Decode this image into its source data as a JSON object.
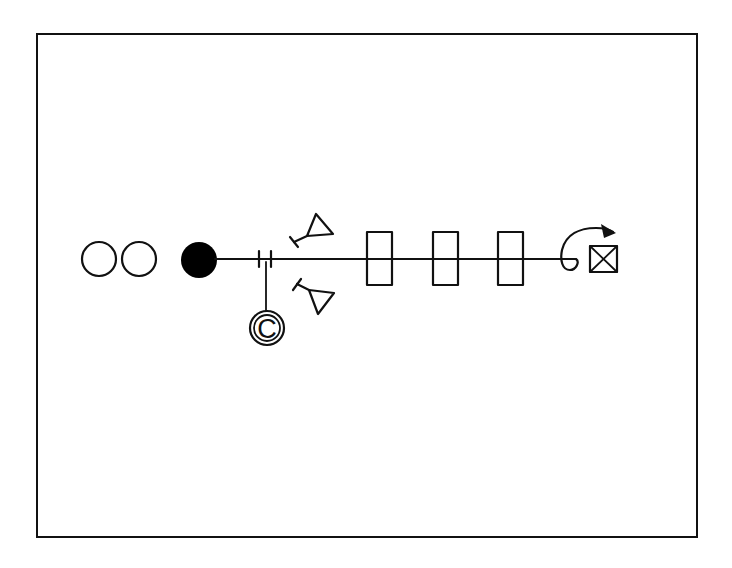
{
  "diagram": {
    "type": "beamline-schematic",
    "colors": {
      "stroke": "#111111",
      "background": "#ffffff",
      "filled_source": "#000000"
    },
    "frame": {
      "x": 37,
      "y": 34,
      "width": 660,
      "height": 503
    },
    "beamline": {
      "y": 259,
      "x_start": 199,
      "x_end": 570
    },
    "elements": [
      {
        "name": "open-circle-1",
        "kind": "open-circle",
        "cx": 99,
        "cy": 259,
        "r": 17
      },
      {
        "name": "open-circle-2",
        "kind": "open-circle",
        "cx": 139,
        "cy": 259,
        "r": 17
      },
      {
        "name": "filled-source",
        "kind": "filled-circle",
        "cx": 199,
        "cy": 260,
        "r": 18
      },
      {
        "name": "capacitor",
        "kind": "capacitor-gap",
        "x1": 259,
        "x2": 271,
        "y_top": 251,
        "y_bottom": 267
      },
      {
        "name": "c-circle",
        "kind": "labeled-circle",
        "cx": 267,
        "cy": 328,
        "r": 17
      },
      {
        "name": "lens-upper",
        "kind": "triangle-lens"
      },
      {
        "name": "lens-lower",
        "kind": "triangle-lens"
      },
      {
        "name": "rect-1",
        "kind": "rectangle",
        "x": 367,
        "y": 232,
        "w": 25,
        "h": 53
      },
      {
        "name": "rect-2",
        "kind": "rectangle",
        "x": 433,
        "y": 232,
        "w": 25,
        "h": 53
      },
      {
        "name": "rect-3",
        "kind": "rectangle",
        "x": 498,
        "y": 232,
        "w": 25,
        "h": 53
      },
      {
        "name": "deflection-arrow",
        "kind": "curved-arrow"
      },
      {
        "name": "x-box",
        "kind": "crossed-box",
        "x": 590,
        "y": 246,
        "w": 27,
        "h": 26
      }
    ],
    "labels": {
      "c_circle": "C"
    }
  }
}
